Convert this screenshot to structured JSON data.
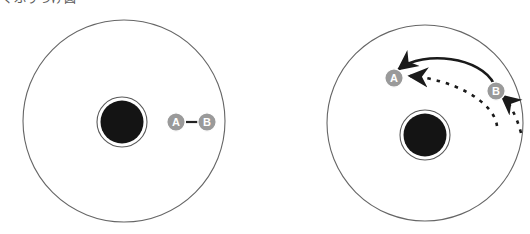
{
  "figure": {
    "caption": "くふりつけ図",
    "background_color": "#ffffff",
    "stroke_color": "#555555",
    "marker_fill_color": "#9a9a9a",
    "marker_text_color": "#ffffff",
    "core_fill_color": "#141414",
    "arrow_color": "#1a1a1a"
  },
  "panels": [
    {
      "id": "left-panel",
      "name": "before-state-diagram",
      "outer_circle": {
        "cx": 124,
        "cy": 121,
        "r": 101
      },
      "core": {
        "cx": 122,
        "cy": 122,
        "r": 22,
        "ring_r": 25
      },
      "markers": [
        {
          "label": "A",
          "cx": 176,
          "cy": 122,
          "r": 9
        },
        {
          "label": "B",
          "cx": 207,
          "cy": 122,
          "r": 9
        }
      ],
      "connector": {
        "x1": 186,
        "y1": 122,
        "x2": 198,
        "y2": 122
      },
      "arcs": []
    },
    {
      "id": "right-panel",
      "name": "after-state-diagram",
      "outer_circle": {
        "cx": 425,
        "cy": 123,
        "r": 98
      },
      "core": {
        "cx": 425,
        "cy": 135,
        "r": 22,
        "ring_r": 25
      },
      "markers": [
        {
          "label": "A",
          "cx": 394,
          "cy": 78,
          "r": 9
        },
        {
          "label": "B",
          "cx": 496,
          "cy": 91,
          "r": 9
        }
      ],
      "connector": null,
      "arcs": [
        {
          "name": "solid-arc-b-to-a",
          "style": "solid",
          "path": "M 494 84 C 480 58 420 52 398 70",
          "arrowhead": {
            "x": 398,
            "y": 70,
            "angle": 205
          }
        },
        {
          "name": "dashed-arc-b-to-a",
          "style": "dashed",
          "path": "M 498 124 C 492 100 450 78 408 76",
          "arrowhead": {
            "x": 408,
            "y": 76,
            "angle": 186
          }
        },
        {
          "name": "dashed-arc-tail",
          "style": "dashed",
          "path": "M 520 131 C 514 112 506 100 500 95",
          "arrowhead": {
            "x": 500,
            "y": 95,
            "angle": 300
          }
        }
      ]
    }
  ]
}
